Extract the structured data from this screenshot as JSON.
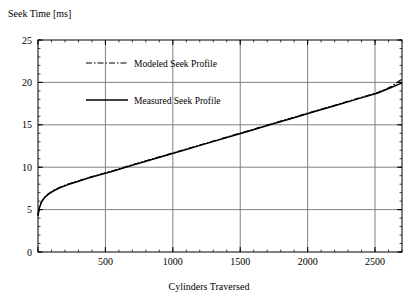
{
  "chart_data": {
    "type": "line",
    "title": "",
    "xlabel": "Cylinders Traversed",
    "ylabel": "Seek Time [ms]",
    "xlim": [
      0,
      2700
    ],
    "ylim": [
      0,
      25
    ],
    "xticks": [
      0,
      500,
      1000,
      1500,
      2000,
      2500
    ],
    "xticklabels": [
      "",
      "500",
      "1000",
      "1500",
      "2000",
      "2500"
    ],
    "yticks": [
      0,
      5,
      10,
      15,
      20,
      25
    ],
    "yticklabels": [
      "0",
      "5",
      "10",
      "15",
      "20",
      "25"
    ],
    "grid": true,
    "grid_color": "#808080",
    "minor_ticks": true,
    "legend_position": "upper left",
    "legend": [
      "Modeled Seek Profile",
      "Measured Seek Profile"
    ],
    "series": [
      {
        "name": "Modeled Seek Profile",
        "style": "dashdot",
        "color": "#000000",
        "x": [
          0,
          10,
          25,
          50,
          80,
          120,
          170,
          230,
          300,
          380,
          460,
          560,
          680,
          800,
          940,
          1080,
          1240,
          1400,
          1560,
          1720,
          1880,
          2040,
          2200,
          2360,
          2520,
          2620,
          2700
        ],
        "y": [
          4.3,
          5.3,
          5.9,
          6.5,
          6.9,
          7.3,
          7.7,
          8.05,
          8.4,
          8.8,
          9.15,
          9.6,
          10.2,
          10.75,
          11.4,
          12.05,
          12.8,
          13.55,
          14.3,
          15.05,
          15.8,
          16.55,
          17.3,
          18.05,
          18.8,
          19.5,
          20.4
        ]
      },
      {
        "name": "Measured Seek Profile",
        "style": "solid",
        "color": "#000000",
        "x": [
          0,
          10,
          25,
          50,
          80,
          120,
          170,
          230,
          300,
          380,
          460,
          560,
          680,
          800,
          940,
          1080,
          1240,
          1400,
          1560,
          1720,
          1880,
          2040,
          2200,
          2360,
          2520,
          2620,
          2700
        ],
        "y": [
          4.3,
          5.2,
          5.85,
          6.45,
          6.85,
          7.25,
          7.62,
          7.98,
          8.35,
          8.75,
          9.1,
          9.55,
          10.15,
          10.7,
          11.35,
          12.0,
          12.75,
          13.5,
          14.25,
          15.0,
          15.75,
          16.5,
          17.25,
          18.0,
          18.75,
          19.4,
          19.95
        ]
      }
    ],
    "legend_entries": [
      {
        "label": "Modeled Seek Profile",
        "style": "dashdot"
      },
      {
        "label": "Measured Seek Profile",
        "style": "solid"
      }
    ]
  },
  "axes": {
    "ylabel_text": "Seek Time [ms]",
    "xlabel_text": "Cylinders Traversed"
  }
}
